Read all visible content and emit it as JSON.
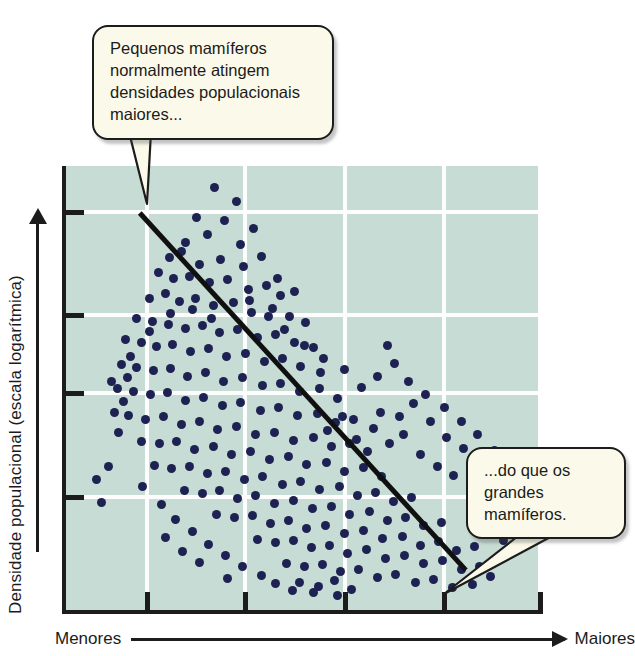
{
  "figure": {
    "title_hidden": "",
    "background_color": "#ffffff",
    "plot_background_color": "#c7dcd4",
    "dot_color": "#1d2252",
    "gridline_color": "#fdfdfd",
    "axis_color": "#1c1c1c",
    "callout_background_color": "#fbfaea"
  },
  "axes": {
    "y_label": "Densidade populacional (escala logarítmica)",
    "y_arrow_direction": "up",
    "x_label_low": "Menores",
    "x_label_high": "Maiores",
    "x_arrow_direction": "right",
    "y_tick_count": 4,
    "x_tick_count": 4
  },
  "callouts": [
    {
      "id": "small-mammals",
      "text": "Pequenos mamíferos normalmente atingem densidades populacionais maiores...",
      "position": "top-left",
      "points_to": "upper-left of scatter cloud"
    },
    {
      "id": "large-mammals",
      "text": "...do que os grandes mamíferos.",
      "position": "bottom-right",
      "points_to": "lower-right end of trend line"
    }
  ],
  "chart_data": {
    "type": "scatter",
    "title": "",
    "xlabel": "Tamanho corporal (Menores → Maiores)",
    "ylabel": "Densidade populacional (escala logarítmica)",
    "xlim": [
      0,
      100
    ],
    "ylim": [
      0,
      100
    ],
    "grid": true,
    "legend": "none",
    "xticks": [
      16.6,
      37.2,
      58.2,
      79.0
    ],
    "yticks": [
      89.7,
      66.7,
      49.3,
      26.1
    ],
    "annotations": [
      "Pequenos mamíferos normalmente atingem densidades populacionais maiores...",
      "...do que os grandes mamíferos."
    ],
    "trendline": {
      "type": "linear-fit",
      "x_start": 15.5,
      "y_start": 89.5,
      "x_end": 84.0,
      "y_end": 9.8,
      "color": "#101010"
    },
    "series": [
      {
        "name": "Mamíferos",
        "marker": "circle",
        "color": "#1d2252",
        "points": [
          [
            31.3,
            95.3
          ],
          [
            35.9,
            92.0
          ],
          [
            27.5,
            88.4
          ],
          [
            33.2,
            87.8
          ],
          [
            39.3,
            86.1
          ],
          [
            25.1,
            83.0
          ],
          [
            29.8,
            84.6
          ],
          [
            36.6,
            82.4
          ],
          [
            21.8,
            79.6
          ],
          [
            24.3,
            80.9
          ],
          [
            28.1,
            78.1
          ],
          [
            32.5,
            79.2
          ],
          [
            37.2,
            77.6
          ],
          [
            41.0,
            79.8
          ],
          [
            19.4,
            76.2
          ],
          [
            22.6,
            74.8
          ],
          [
            26.0,
            75.4
          ],
          [
            30.2,
            73.9
          ],
          [
            34.0,
            74.6
          ],
          [
            38.4,
            72.5
          ],
          [
            42.1,
            73.4
          ],
          [
            45.0,
            71.0
          ],
          [
            17.6,
            70.4
          ],
          [
            20.8,
            71.6
          ],
          [
            23.9,
            69.8
          ],
          [
            27.3,
            70.5
          ],
          [
            31.0,
            68.9
          ],
          [
            35.2,
            69.6
          ],
          [
            39.0,
            67.4
          ],
          [
            43.4,
            68.2
          ],
          [
            47.0,
            66.5
          ],
          [
            50.4,
            65.1
          ],
          [
            14.9,
            66.0
          ],
          [
            18.2,
            65.2
          ],
          [
            21.5,
            64.6
          ],
          [
            25.0,
            63.8
          ],
          [
            28.6,
            64.4
          ],
          [
            32.3,
            62.9
          ],
          [
            36.1,
            63.6
          ],
          [
            40.2,
            61.8
          ],
          [
            44.0,
            62.4
          ],
          [
            48.1,
            60.6
          ],
          [
            52.0,
            59.4
          ],
          [
            12.4,
            61.2
          ],
          [
            15.8,
            60.5
          ],
          [
            19.0,
            59.7
          ],
          [
            22.4,
            60.2
          ],
          [
            26.1,
            58.6
          ],
          [
            29.9,
            59.3
          ],
          [
            33.7,
            57.5
          ],
          [
            37.8,
            58.1
          ],
          [
            41.6,
            56.4
          ],
          [
            45.5,
            57.0
          ],
          [
            49.3,
            55.2
          ],
          [
            53.4,
            54.0
          ],
          [
            11.6,
            55.8
          ],
          [
            14.8,
            55.0
          ],
          [
            18.3,
            54.3
          ],
          [
            21.9,
            54.9
          ],
          [
            25.6,
            53.1
          ],
          [
            29.4,
            53.8
          ],
          [
            33.1,
            52.0
          ],
          [
            37.0,
            52.7
          ],
          [
            41.2,
            50.9
          ],
          [
            45.1,
            51.5
          ],
          [
            49.0,
            49.7
          ],
          [
            53.2,
            50.3
          ],
          [
            57.0,
            48.2
          ],
          [
            10.9,
            50.4
          ],
          [
            14.1,
            49.6
          ],
          [
            17.7,
            48.9
          ],
          [
            21.4,
            49.4
          ],
          [
            25.0,
            47.7
          ],
          [
            28.9,
            48.3
          ],
          [
            32.8,
            46.5
          ],
          [
            36.7,
            47.2
          ],
          [
            40.8,
            45.4
          ],
          [
            44.7,
            46.0
          ],
          [
            48.6,
            44.2
          ],
          [
            52.8,
            44.8
          ],
          [
            56.6,
            42.8
          ],
          [
            60.4,
            43.5
          ],
          [
            13.2,
            44.2
          ],
          [
            16.8,
            43.5
          ],
          [
            20.5,
            44.0
          ],
          [
            24.2,
            42.3
          ],
          [
            28.0,
            42.9
          ],
          [
            31.9,
            41.1
          ],
          [
            35.8,
            41.8
          ],
          [
            39.9,
            40.0
          ],
          [
            43.8,
            40.6
          ],
          [
            47.7,
            38.8
          ],
          [
            51.9,
            39.4
          ],
          [
            55.7,
            37.4
          ],
          [
            59.5,
            38.1
          ],
          [
            63.3,
            36.2
          ],
          [
            15.9,
            38.6
          ],
          [
            19.6,
            38.0
          ],
          [
            23.3,
            38.5
          ],
          [
            27.1,
            36.8
          ],
          [
            30.9,
            37.4
          ],
          [
            34.8,
            35.6
          ],
          [
            38.7,
            36.3
          ],
          [
            42.8,
            34.5
          ],
          [
            46.7,
            35.1
          ],
          [
            50.6,
            33.3
          ],
          [
            54.8,
            33.9
          ],
          [
            58.6,
            31.9
          ],
          [
            62.4,
            32.6
          ],
          [
            66.2,
            30.7
          ],
          [
            18.5,
            33.1
          ],
          [
            22.2,
            32.5
          ],
          [
            25.9,
            33.0
          ],
          [
            29.7,
            31.3
          ],
          [
            33.5,
            31.9
          ],
          [
            37.4,
            30.1
          ],
          [
            41.3,
            30.8
          ],
          [
            45.4,
            29.0
          ],
          [
            49.3,
            29.6
          ],
          [
            53.2,
            27.8
          ],
          [
            57.4,
            28.4
          ],
          [
            61.2,
            26.4
          ],
          [
            65.0,
            27.1
          ],
          [
            68.8,
            25.2
          ],
          [
            72.5,
            26.0
          ],
          [
            24.8,
            27.6
          ],
          [
            28.6,
            27.0
          ],
          [
            32.3,
            27.5
          ],
          [
            36.1,
            25.8
          ],
          [
            39.9,
            26.4
          ],
          [
            43.8,
            24.6
          ],
          [
            47.7,
            25.3
          ],
          [
            51.8,
            23.5
          ],
          [
            55.7,
            24.1
          ],
          [
            59.6,
            22.3
          ],
          [
            63.8,
            22.9
          ],
          [
            67.6,
            20.9
          ],
          [
            71.4,
            21.6
          ],
          [
            75.2,
            19.7
          ],
          [
            78.9,
            20.5
          ],
          [
            31.6,
            22.1
          ],
          [
            35.4,
            21.5
          ],
          [
            39.1,
            22.0
          ],
          [
            42.9,
            20.3
          ],
          [
            46.7,
            20.9
          ],
          [
            50.6,
            19.1
          ],
          [
            54.5,
            19.8
          ],
          [
            58.6,
            18.0
          ],
          [
            62.5,
            18.6
          ],
          [
            66.4,
            16.8
          ],
          [
            70.6,
            17.4
          ],
          [
            74.4,
            15.4
          ],
          [
            78.2,
            16.1
          ],
          [
            82.0,
            14.2
          ],
          [
            85.8,
            15.0
          ],
          [
            40.2,
            16.6
          ],
          [
            44.0,
            16.0
          ],
          [
            47.7,
            16.5
          ],
          [
            51.5,
            14.8
          ],
          [
            55.3,
            15.4
          ],
          [
            59.2,
            13.6
          ],
          [
            63.1,
            14.3
          ],
          [
            67.2,
            12.5
          ],
          [
            71.1,
            13.1
          ],
          [
            75.0,
            11.3
          ],
          [
            79.2,
            11.9
          ],
          [
            83.0,
            9.9
          ],
          [
            86.8,
            10.6
          ],
          [
            46.4,
            11.2
          ],
          [
            50.2,
            10.6
          ],
          [
            53.9,
            11.1
          ],
          [
            57.7,
            9.4
          ],
          [
            61.5,
            10.0
          ],
          [
            65.4,
            8.2
          ],
          [
            69.3,
            8.9
          ],
          [
            73.4,
            7.1
          ],
          [
            77.3,
            7.7
          ],
          [
            81.2,
            5.9
          ],
          [
            85.4,
            6.5
          ],
          [
            89.2,
            8.4
          ],
          [
            10.2,
            45.0
          ],
          [
            11.0,
            40.5
          ],
          [
            9.6,
            52.0
          ],
          [
            13.0,
            52.8
          ],
          [
            12.0,
            47.5
          ],
          [
            55.0,
            41.0
          ],
          [
            58.0,
            44.0
          ],
          [
            61.0,
            39.0
          ],
          [
            64.5,
            41.5
          ],
          [
            68.0,
            38.0
          ],
          [
            71.0,
            40.0
          ],
          [
            74.5,
            35.5
          ],
          [
            78.0,
            33.0
          ],
          [
            81.5,
            31.0
          ],
          [
            85.0,
            28.0
          ],
          [
            88.0,
            24.0
          ],
          [
            90.5,
            20.0
          ],
          [
            92.0,
            16.5
          ],
          [
            66.0,
            45.0
          ],
          [
            70.0,
            44.0
          ],
          [
            73.0,
            47.0
          ],
          [
            76.5,
            43.0
          ],
          [
            80.0,
            39.5
          ],
          [
            83.5,
            37.0
          ],
          [
            87.0,
            34.0
          ],
          [
            90.0,
            30.5
          ],
          [
            93.0,
            27.0
          ],
          [
            49.0,
            7.0
          ],
          [
            53.0,
            6.2
          ],
          [
            56.5,
            7.4
          ],
          [
            60.0,
            5.5
          ],
          [
            52.0,
            4.8
          ],
          [
            57.0,
            4.2
          ],
          [
            47.5,
            5.2
          ],
          [
            44.0,
            6.8
          ],
          [
            6.5,
            30.0
          ],
          [
            7.5,
            25.0
          ],
          [
            9.0,
            33.0
          ],
          [
            16.0,
            28.5
          ],
          [
            20.0,
            24.5
          ],
          [
            23.0,
            21.0
          ],
          [
            26.5,
            18.5
          ],
          [
            30.0,
            15.5
          ],
          [
            33.5,
            13.0
          ],
          [
            37.0,
            10.5
          ],
          [
            41.0,
            8.5
          ],
          [
            28.0,
            11.5
          ],
          [
            24.5,
            14.0
          ],
          [
            21.0,
            17.0
          ],
          [
            34.0,
            8.0
          ],
          [
            62.0,
            50.5
          ],
          [
            65.5,
            53.0
          ],
          [
            58.5,
            54.5
          ],
          [
            54.0,
            57.0
          ],
          [
            50.0,
            60.0
          ],
          [
            46.0,
            63.5
          ],
          [
            42.5,
            66.5
          ],
          [
            38.5,
            70.0
          ],
          [
            44.5,
            75.0
          ],
          [
            48.0,
            72.0
          ],
          [
            30.5,
            66.0
          ],
          [
            26.5,
            68.0
          ],
          [
            22.0,
            67.0
          ],
          [
            17.5,
            63.0
          ],
          [
            13.5,
            57.5
          ],
          [
            69.0,
            56.0
          ],
          [
            72.0,
            52.0
          ],
          [
            75.5,
            49.0
          ],
          [
            79.5,
            46.0
          ],
          [
            83.0,
            43.0
          ],
          [
            86.5,
            40.0
          ],
          [
            90.0,
            36.5
          ],
          [
            93.5,
            33.0
          ],
          [
            95.0,
            29.0
          ],
          [
            67.5,
            60.0
          ]
        ]
      }
    ]
  }
}
